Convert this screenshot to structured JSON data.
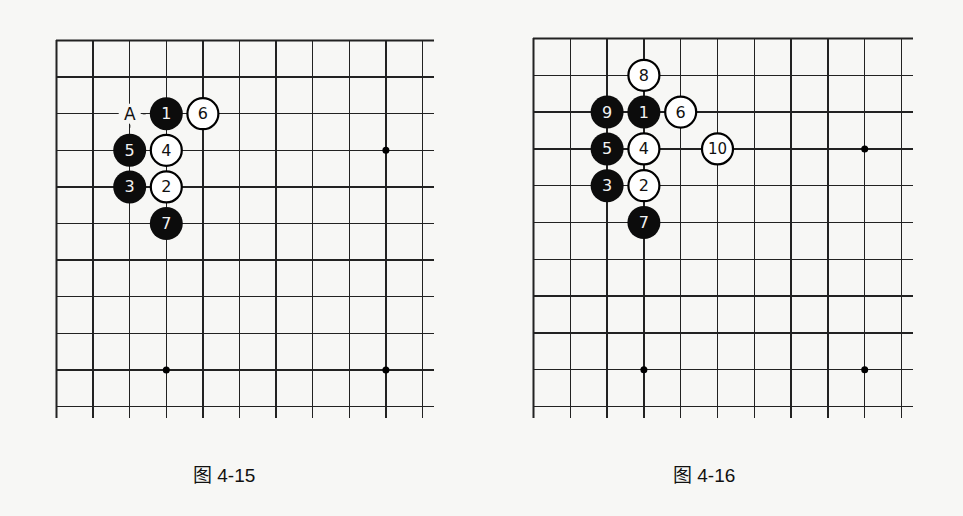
{
  "figures": [
    {
      "id": "left",
      "caption": "图 4-15",
      "origin": [
        56,
        40
      ],
      "spacing": 36.6,
      "cols": 11,
      "rows": 11,
      "star_points": [
        [
          3,
          9
        ],
        [
          9,
          3
        ],
        [
          9,
          9
        ]
      ],
      "stones": [
        {
          "col": 3,
          "row": 2,
          "color": "black",
          "label": "1"
        },
        {
          "col": 3,
          "row": 4,
          "color": "white",
          "label": "2"
        },
        {
          "col": 2,
          "row": 4,
          "color": "black",
          "label": "3"
        },
        {
          "col": 3,
          "row": 3,
          "color": "white",
          "label": "4"
        },
        {
          "col": 2,
          "row": 3,
          "color": "black",
          "label": "5"
        },
        {
          "col": 4,
          "row": 2,
          "color": "white",
          "label": "6"
        },
        {
          "col": 3,
          "row": 5,
          "color": "black",
          "label": "7"
        }
      ],
      "markers": [
        {
          "col": 2,
          "row": 2,
          "label": "A"
        }
      ]
    },
    {
      "id": "right",
      "caption": "图 4-16",
      "origin": [
        533,
        38
      ],
      "spacing": 36.8,
      "cols": 11,
      "rows": 11,
      "star_points": [
        [
          3,
          9
        ],
        [
          9,
          3
        ],
        [
          9,
          9
        ]
      ],
      "stones": [
        {
          "col": 3,
          "row": 2,
          "color": "black",
          "label": "1"
        },
        {
          "col": 3,
          "row": 4,
          "color": "white",
          "label": "2"
        },
        {
          "col": 2,
          "row": 4,
          "color": "black",
          "label": "3"
        },
        {
          "col": 3,
          "row": 3,
          "color": "white",
          "label": "4"
        },
        {
          "col": 2,
          "row": 3,
          "color": "black",
          "label": "5"
        },
        {
          "col": 4,
          "row": 2,
          "color": "white",
          "label": "6"
        },
        {
          "col": 3,
          "row": 5,
          "color": "black",
          "label": "7"
        },
        {
          "col": 3,
          "row": 1,
          "color": "white",
          "label": "8"
        },
        {
          "col": 2,
          "row": 2,
          "color": "black",
          "label": "9"
        },
        {
          "col": 5,
          "row": 3,
          "color": "white",
          "label": "10"
        }
      ],
      "markers": []
    }
  ],
  "colors": {
    "line": "#222222",
    "black_stone": "#0c0c0c",
    "white_stone": "#ffffff",
    "black_label": "#f2f2f2",
    "white_label": "#111111"
  }
}
